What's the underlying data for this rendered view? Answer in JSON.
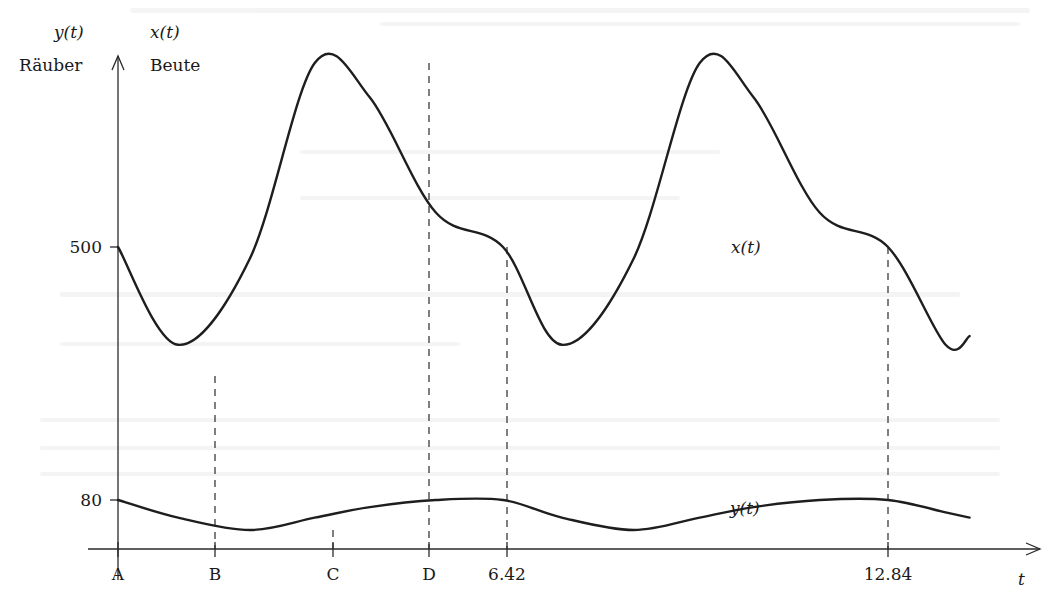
{
  "figure": {
    "y_axis_labels": {
      "predator_symbol": "y(t)",
      "predator_name": "Räuber",
      "prey_symbol": "x(t)",
      "prey_name": "Beute"
    },
    "x_axis_label": "t",
    "y_ticks": [
      {
        "label": "500",
        "value": 500
      },
      {
        "label": "80",
        "value": 80
      }
    ],
    "x_ticks": [
      {
        "label": "A",
        "key": "A"
      },
      {
        "label": "B",
        "key": "B"
      },
      {
        "label": "C",
        "key": "C"
      },
      {
        "label": "D",
        "key": "D"
      },
      {
        "label": "6.42",
        "key": "T1"
      },
      {
        "label": "12.84",
        "key": "T2"
      }
    ],
    "curve_labels": {
      "prey": "x(t)",
      "predator": "y(t)"
    }
  },
  "chart_data": {
    "type": "line",
    "title": "",
    "xlabel": "t",
    "ylabel_left": "y(t) Räuber",
    "ylabel_right": "x(t) Beute",
    "x_tick_labels": [
      "A",
      "B",
      "C",
      "D",
      "6.42",
      "12.84"
    ],
    "y_tick_labels": [
      "500",
      "80"
    ],
    "period": 6.42,
    "grid": false,
    "legend": "inline curve labels",
    "series": [
      {
        "name": "x(t) (Beute / prey)",
        "t": [
          0,
          1.0,
          2.2,
          3.28,
          4.2,
          5.3,
          6.42,
          7.4,
          8.6,
          9.7,
          10.6,
          11.7,
          12.84,
          13.8,
          14.2
        ],
        "values": [
          500,
          330,
          480,
          820,
          760,
          560,
          500,
          330,
          480,
          820,
          760,
          560,
          500,
          330,
          345
        ],
        "annotations": {
          "minimum_at": "B",
          "maximum_at": "D",
          "value_at_A": 500
        }
      },
      {
        "name": "y(t) (Räuber / predator)",
        "t": [
          0,
          1.0,
          2.2,
          3.28,
          4.2,
          5.3,
          6.42,
          7.4,
          8.6,
          9.7,
          10.6,
          11.7,
          12.84,
          13.8,
          14.2
        ],
        "values": [
          80,
          70,
          63,
          70,
          76,
          80,
          80,
          70,
          63,
          70,
          76,
          80,
          80,
          73,
          70
        ],
        "annotations": {
          "maximum_at": "A",
          "minimum_at": "C"
        }
      }
    ],
    "reference_lines": [
      {
        "t_label": "B",
        "type": "dashed",
        "meaning": "x(t) minimum"
      },
      {
        "t_label": "C",
        "type": "dashed",
        "meaning": "y(t) minimum"
      },
      {
        "t_label": "D",
        "type": "dashed",
        "meaning": "x(t) maximum"
      },
      {
        "t_label": "6.42",
        "type": "dashed",
        "meaning": "period; x=500, y=80"
      },
      {
        "t_label": "12.84",
        "type": "dashed",
        "meaning": "two periods; x=500, y=80"
      }
    ]
  }
}
